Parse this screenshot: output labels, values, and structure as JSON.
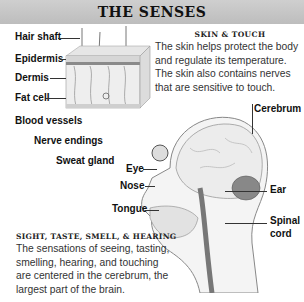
{
  "title": "THE SENSES",
  "skin_diagram": {
    "labels": {
      "hair_shaft": "Hair shaft",
      "epidermis": "Epidermis",
      "dermis": "Dermis",
      "fat_cell": "Fat cell",
      "blood_vessels": "Blood vessels",
      "nerve_endings": "Nerve endings",
      "sweat_gland": "Sweat gland"
    }
  },
  "skin_section": {
    "heading": "SKIN & TOUCH",
    "body": "The skin helps protect the body and regulate its temperature. The skin also contains nerves that are sensitive to touch."
  },
  "head_diagram": {
    "labels": {
      "cerebrum": "Cerebrum",
      "eye": "Eye",
      "nose": "Nose",
      "ear": "Ear",
      "tongue": "Tongue",
      "spinal": "Spinal",
      "cord": "cord"
    }
  },
  "senses_section": {
    "heading": "SIGHT, TASTE, SMELL, & HEARING",
    "body": "The sensations of seeing, tasting, smelling, hearing, and touching are centered in the cerebrum, the largest part of the brain."
  }
}
